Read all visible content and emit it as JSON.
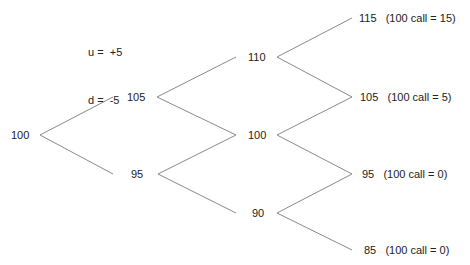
{
  "parameters": {
    "up": "u =  +5",
    "down": "d =  -5"
  },
  "tree": {
    "line_color": "#8a8a8a",
    "nodes": [
      {
        "id": "n0",
        "label": "100",
        "x": 11,
        "y": 129
      },
      {
        "id": "n1u",
        "label": "105",
        "x": 127,
        "y": 91
      },
      {
        "id": "n1d",
        "label": "95",
        "x": 131,
        "y": 168
      },
      {
        "id": "n2uu",
        "label": "110",
        "x": 248,
        "y": 51
      },
      {
        "id": "n2ud",
        "label": "100",
        "x": 248,
        "y": 129
      },
      {
        "id": "n2dd",
        "label": "90",
        "x": 252,
        "y": 207
      },
      {
        "id": "n3uuu",
        "label": "115   (100 call = 15)",
        "x": 359,
        "y": 12
      },
      {
        "id": "n3uud",
        "label": "105   (100 call = 5)",
        "x": 360,
        "y": 91
      },
      {
        "id": "n3udd",
        "label": "95   (100 call = 0)",
        "x": 362,
        "y": 168
      },
      {
        "id": "n3ddd",
        "label": "85   (100 call = 0)",
        "x": 364,
        "y": 244
      }
    ],
    "edges": [
      {
        "x1": 40,
        "y1": 135,
        "x2": 113,
        "y2": 97
      },
      {
        "x1": 40,
        "y1": 135,
        "x2": 113,
        "y2": 174
      },
      {
        "x1": 157,
        "y1": 97,
        "x2": 236,
        "y2": 57
      },
      {
        "x1": 157,
        "y1": 97,
        "x2": 236,
        "y2": 135
      },
      {
        "x1": 158,
        "y1": 174,
        "x2": 236,
        "y2": 135
      },
      {
        "x1": 158,
        "y1": 174,
        "x2": 236,
        "y2": 213
      },
      {
        "x1": 277,
        "y1": 57,
        "x2": 352,
        "y2": 18
      },
      {
        "x1": 277,
        "y1": 57,
        "x2": 352,
        "y2": 97
      },
      {
        "x1": 277,
        "y1": 135,
        "x2": 352,
        "y2": 97
      },
      {
        "x1": 277,
        "y1": 135,
        "x2": 352,
        "y2": 174
      },
      {
        "x1": 277,
        "y1": 213,
        "x2": 352,
        "y2": 174
      },
      {
        "x1": 277,
        "y1": 213,
        "x2": 352,
        "y2": 250
      }
    ]
  }
}
